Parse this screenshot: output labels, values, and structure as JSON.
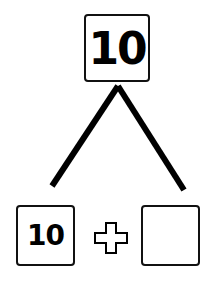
{
  "diagram": {
    "type": "number-bond",
    "whole": "10",
    "parts": [
      "10",
      ""
    ],
    "operator": "+"
  }
}
